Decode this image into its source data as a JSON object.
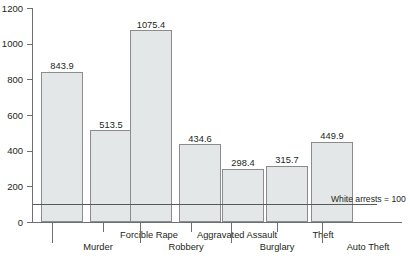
{
  "chart_data": {
    "type": "bar",
    "title": "",
    "subtitle": "",
    "xlabel": "",
    "ylabel": "",
    "categories": [
      "Murder",
      "Forcible Rape",
      "Robbery",
      "Aggravated Assault",
      "Burglary",
      "Theft",
      "Auto Theft"
    ],
    "values": [
      843.9,
      513.5,
      1075.4,
      434.6,
      298.4,
      315.7,
      449.9
    ],
    "value_labels": [
      "843.9",
      "513.5",
      "1075.4",
      "434.6",
      "298.4",
      "315.7",
      "449.9"
    ],
    "ylim": [
      0,
      1200
    ],
    "yticks": [
      0,
      200,
      400,
      600,
      800,
      1000,
      1200
    ],
    "ytick_labels": [
      "0",
      "200",
      "400",
      "600",
      "800",
      "1000",
      "1200"
    ],
    "grid": false,
    "legend": "none",
    "annotations": [
      {
        "name": "reference-line",
        "text": "White arrests = 100",
        "value": 100,
        "orientation": "horizontal"
      }
    ],
    "bar_fill_color": "#e4e7e7",
    "bar_border_color": "#8a8c8e",
    "axis_color": "#6e7072",
    "text_color": "#231f20",
    "background_color": "#ffffff"
  },
  "caption": {
    "text": ""
  }
}
